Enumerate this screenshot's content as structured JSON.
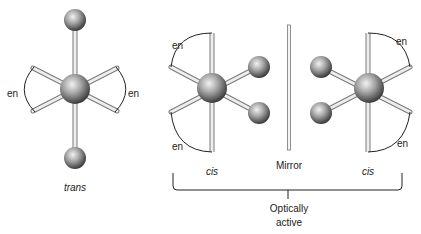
{
  "diagram": {
    "ligand_label": "en",
    "isomers": [
      {
        "name": "trans",
        "label": "trans"
      },
      {
        "name": "cis-left",
        "label": "cis"
      },
      {
        "name": "cis-right",
        "label": "cis"
      }
    ],
    "mirror_label": "Mirror",
    "bracket_label_line1": "Optically",
    "bracket_label_line2": "active",
    "colors": {
      "stick": "#e8e8e8",
      "stick_outline": "#7a7a7a",
      "ball_light": "#e6e6e6",
      "ball_dark": "#4a4a4a",
      "line": "#222222"
    }
  }
}
